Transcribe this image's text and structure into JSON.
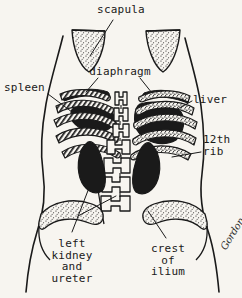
{
  "figure": {
    "kind": "anatomy-line-drawing",
    "view": "posterior-trunk-surface-markings",
    "background_color": "#f7f5f0",
    "ink_color": "#1a1a1a",
    "signature": "Gordon"
  },
  "labels": {
    "scapula": {
      "text": "scapula",
      "align": "center",
      "x": 121,
      "y": 4
    },
    "diaphragm": {
      "text": "diaphragm",
      "align": "center",
      "x": 120,
      "y": 66
    },
    "spleen": {
      "text": "spleen",
      "align": "left",
      "x": 4,
      "y": 82
    },
    "liver": {
      "text": "liver",
      "align": "left",
      "x": 193,
      "y": 94
    },
    "rib_12th": {
      "text": "12th\nrib",
      "align": "left",
      "x": 203,
      "y": 134
    },
    "left_kidney_and_ureter": {
      "text": "left\nkidney\nand\nureter",
      "align": "center",
      "x": 72,
      "y": 238
    },
    "crest_of_ilium": {
      "text": "crest\nof\nilium",
      "align": "center",
      "x": 168,
      "y": 243
    }
  },
  "structures": [
    {
      "name": "body-outline-left",
      "kind": "contour",
      "fill": "none"
    },
    {
      "name": "body-outline-right",
      "kind": "contour",
      "fill": "none"
    },
    {
      "name": "scapula-left",
      "kind": "bone",
      "texture": "stipple"
    },
    {
      "name": "scapula-right",
      "kind": "bone",
      "texture": "stipple"
    },
    {
      "name": "diaphragm-left",
      "kind": "muscle",
      "texture": "solid"
    },
    {
      "name": "diaphragm-right",
      "kind": "muscle",
      "texture": "solid"
    },
    {
      "name": "spleen",
      "kind": "organ",
      "texture": "solid"
    },
    {
      "name": "liver",
      "kind": "organ",
      "texture": "solid"
    },
    {
      "name": "rib-cage-left",
      "kind": "bone",
      "texture": "hatched"
    },
    {
      "name": "rib-cage-right",
      "kind": "bone",
      "texture": "stipple"
    },
    {
      "name": "rib-12th-left",
      "kind": "bone",
      "texture": "hatched"
    },
    {
      "name": "rib-12th-right",
      "kind": "bone",
      "texture": "stipple"
    },
    {
      "name": "vertebral-column",
      "kind": "bone",
      "texture": "outline"
    },
    {
      "name": "kidney-left",
      "kind": "organ",
      "texture": "solid"
    },
    {
      "name": "kidney-right",
      "kind": "organ",
      "texture": "solid"
    },
    {
      "name": "ureter-left",
      "kind": "organ",
      "texture": "outline"
    },
    {
      "name": "iliac-crest-left",
      "kind": "bone",
      "texture": "stipple"
    },
    {
      "name": "iliac-crest-right",
      "kind": "bone",
      "texture": "stipple"
    }
  ],
  "leader_lines": [
    {
      "name": "leader-scapula",
      "from_label": "scapula"
    },
    {
      "name": "leader-diaphragm-left",
      "from_label": "diaphragm"
    },
    {
      "name": "leader-diaphragm-right",
      "from_label": "diaphragm"
    },
    {
      "name": "leader-spleen",
      "from_label": "spleen"
    },
    {
      "name": "leader-liver",
      "from_label": "liver"
    },
    {
      "name": "leader-12th-rib",
      "from_label": "rib_12th"
    },
    {
      "name": "leader-left-kidney",
      "from_label": "left_kidney_and_ureter"
    },
    {
      "name": "leader-ureter",
      "from_label": "left_kidney_and_ureter"
    },
    {
      "name": "leader-crest-ilium",
      "from_label": "crest_of_ilium"
    }
  ]
}
